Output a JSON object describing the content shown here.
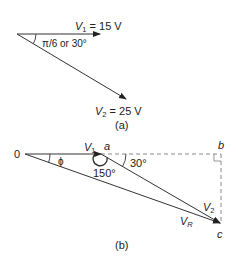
{
  "diagram": {
    "part_a": {
      "caption": "(a)",
      "v1_label": "V",
      "v1_sub": "1",
      "v1_value": " = 15 V",
      "v2_label": "V",
      "v2_sub": "2",
      "v2_value": " = 25 V",
      "angle_label": "π/6 or 30°"
    },
    "part_b": {
      "caption": "(b)",
      "origin_label": "0",
      "phi_label": "ϕ",
      "v1_label": "V",
      "v1_sub": "1",
      "point_a": "a",
      "point_b": "b",
      "point_c": "c",
      "angle_150": "150°",
      "angle_30": "30°",
      "v2_label": "V",
      "v2_sub": "2",
      "vr_label": "V",
      "vr_sub": "R"
    },
    "colors": {
      "line": "#333333",
      "dashed": "#888888",
      "text": "#222222"
    }
  }
}
